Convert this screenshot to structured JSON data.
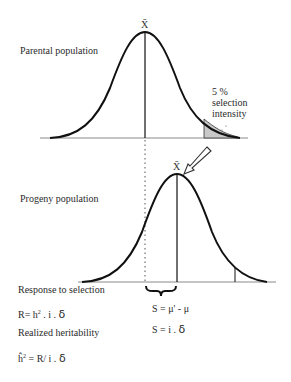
{
  "labels": {
    "parental": "Parental population",
    "progeny": "Progeny population",
    "selection_pct": "5 %",
    "selection_word": "selection",
    "intensity_word": "intensity",
    "mean_symbol_parent": "X̄",
    "mean_symbol_progeny": "X̄",
    "response_title": "Response to selection",
    "response_formula_prefix": "R= h",
    "response_formula_sup": "2",
    "response_formula_suffix": " . i .",
    "delta": "δ",
    "s_formula_1": "S = μ' - μ",
    "s_formula_2_prefix": "S = i .",
    "realized_title": "Realized heritability",
    "realized_prefix": "ĥ",
    "realized_sup": "2",
    "realized_suffix": " = R/ i ."
  },
  "colors": {
    "curve": "#111111",
    "baseline": "#888888",
    "shade": "#c8c8c8",
    "text": "#2a2a2a"
  }
}
